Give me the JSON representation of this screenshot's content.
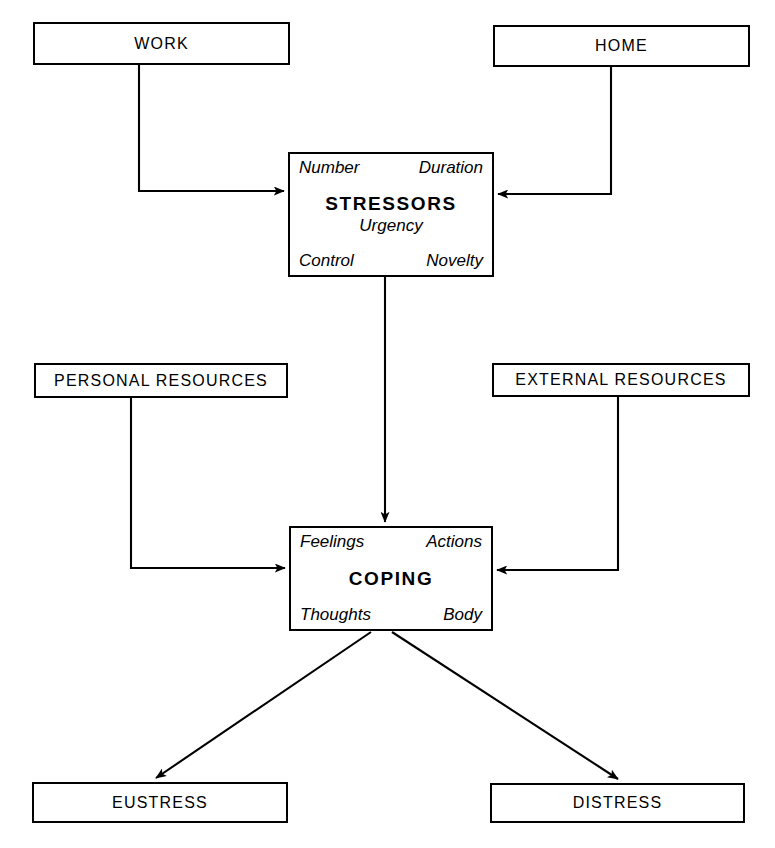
{
  "diagram": {
    "type": "flowchart",
    "orientation": "top-to-bottom",
    "line_color": "#000000",
    "background_color": "#ffffff",
    "nodes": [
      {
        "id": "work",
        "label": "WORK",
        "shape": "rectangle",
        "x": 33,
        "y": 22,
        "w": 257,
        "h": 43
      },
      {
        "id": "home",
        "label": "HOME",
        "shape": "rectangle",
        "x": 493,
        "y": 25,
        "w": 257,
        "h": 42
      },
      {
        "id": "stressors",
        "label": "STRESSORS",
        "shape": "rectangle",
        "x": 288,
        "y": 152,
        "w": 206,
        "h": 125,
        "attributes_top": [
          "Number",
          "Duration"
        ],
        "attribute_middle": "Urgency",
        "attributes_bottom": [
          "Control",
          "Novelty"
        ]
      },
      {
        "id": "personal_resources",
        "label": "PERSONAL RESOURCES",
        "shape": "rectangle",
        "x": 34,
        "y": 363,
        "w": 254,
        "h": 35
      },
      {
        "id": "external_resources",
        "label": "EXTERNAL RESOURCES",
        "shape": "rectangle",
        "x": 492,
        "y": 363,
        "w": 258,
        "h": 34
      },
      {
        "id": "coping",
        "label": "COPING",
        "shape": "rectangle",
        "x": 289,
        "y": 526,
        "w": 204,
        "h": 105,
        "attributes_top": [
          "Feelings",
          "Actions"
        ],
        "attributes_bottom": [
          "Thoughts",
          "Body"
        ]
      },
      {
        "id": "eustress",
        "label": "EUSTRESS",
        "shape": "rectangle",
        "x": 32,
        "y": 782,
        "w": 256,
        "h": 41
      },
      {
        "id": "distress",
        "label": "DISTRESS",
        "shape": "rectangle",
        "x": 490,
        "y": 783,
        "w": 255,
        "h": 40
      }
    ],
    "edges": [
      {
        "id": "work-to-stressors",
        "from": "work",
        "to": "stressors",
        "style": "orthogonal",
        "arrow": "end"
      },
      {
        "id": "home-to-stressors",
        "from": "home",
        "to": "stressors",
        "style": "orthogonal",
        "arrow": "end"
      },
      {
        "id": "stressors-to-coping",
        "from": "stressors",
        "to": "coping",
        "style": "straight-vertical",
        "arrow": "end"
      },
      {
        "id": "personal-resources-to-coping",
        "from": "personal_resources",
        "to": "coping",
        "style": "orthogonal",
        "arrow": "end"
      },
      {
        "id": "external-resources-to-coping",
        "from": "external_resources",
        "to": "coping",
        "style": "orthogonal",
        "arrow": "end"
      },
      {
        "id": "coping-to-eustress",
        "from": "coping",
        "to": "eustress",
        "style": "diagonal",
        "arrow": "end"
      },
      {
        "id": "coping-to-distress",
        "from": "coping",
        "to": "distress",
        "style": "diagonal",
        "arrow": "end"
      }
    ]
  }
}
